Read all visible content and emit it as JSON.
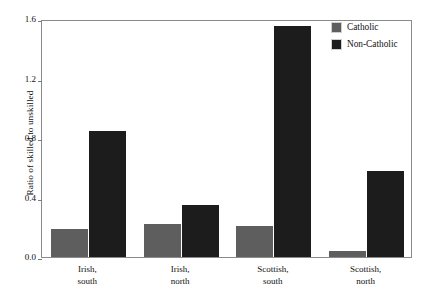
{
  "chart_data": {
    "type": "bar",
    "title": "",
    "xlabel": "",
    "ylabel": "Ratio of skilled to unskilled",
    "categories": [
      "Irish, south",
      "Irish, north",
      "Scottish, south",
      "Scottish, north"
    ],
    "category_lines": [
      [
        "Irish,",
        "south"
      ],
      [
        "Irish,",
        "north"
      ],
      [
        "Scottish,",
        "south"
      ],
      [
        "Scottish,",
        "north"
      ]
    ],
    "series": [
      {
        "name": "Catholic",
        "color": "#5e5e5e",
        "values": [
          0.19,
          0.22,
          0.21,
          0.04
        ]
      },
      {
        "name": "Non-Catholic",
        "color": "#1c1c1c",
        "values": [
          0.85,
          0.35,
          1.55,
          0.58
        ]
      }
    ],
    "ylim": [
      0.0,
      1.6
    ],
    "yticks": [
      0.0,
      0.4,
      0.8,
      1.2,
      1.6
    ],
    "ytick_labels": [
      "0.0",
      "0.4",
      "0.8",
      "1.2",
      "1.6"
    ],
    "grid": false,
    "legend_position": "top-right"
  },
  "legend": {
    "entries": [
      {
        "label": "Catholic",
        "color": "#5e5e5e"
      },
      {
        "label": "Non-Catholic",
        "color": "#1c1c1c"
      }
    ]
  },
  "axis": {
    "y_title": "Ratio of skilled to unskilled"
  }
}
